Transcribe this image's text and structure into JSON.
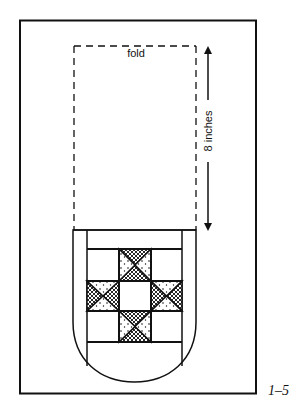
{
  "diagram": {
    "fold_label": "fold",
    "measure_label": "8 inches",
    "figure_number": "1–5",
    "colors": {
      "stroke": "#111111",
      "background": "#ffffff"
    },
    "parts": [
      {
        "name": "outer-fabric-rectangle"
      },
      {
        "name": "fold-dashed-outline"
      },
      {
        "name": "measurement-arrow",
        "direction": "vertical-double"
      },
      {
        "name": "pocket",
        "shape": "rounded-bottom"
      },
      {
        "name": "quilt-block",
        "pattern": "ohio-star",
        "grid": "3x3",
        "fills": [
          "crosshatch",
          "dotted",
          "plain"
        ]
      }
    ]
  }
}
